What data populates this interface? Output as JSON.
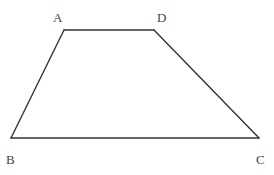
{
  "figure": {
    "type": "trapezoid",
    "vertices": [
      {
        "name": "A",
        "x": 64,
        "y": 30,
        "label_x": 53,
        "label_y": 22
      },
      {
        "name": "D",
        "x": 154,
        "y": 30,
        "label_x": 157,
        "label_y": 22
      },
      {
        "name": "B",
        "x": 11,
        "y": 138,
        "label_x": 6,
        "label_y": 164
      },
      {
        "name": "C",
        "x": 259,
        "y": 138,
        "label_x": 256,
        "label_y": 164
      }
    ],
    "edges": [
      [
        "A",
        "D"
      ],
      [
        "D",
        "C"
      ],
      [
        "C",
        "B"
      ],
      [
        "B",
        "A"
      ]
    ],
    "labels": {
      "A": "A",
      "B": "B",
      "C": "C",
      "D": "D"
    },
    "stroke_color": "#333333"
  }
}
